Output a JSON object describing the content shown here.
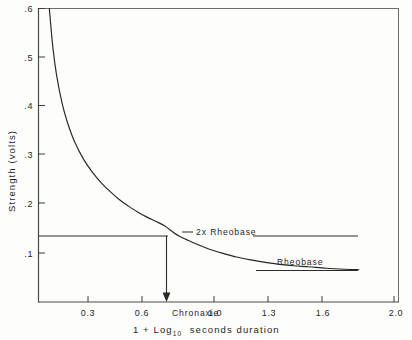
{
  "chart_data": {
    "type": "line",
    "title": "",
    "subtitle": "",
    "xlabel": "1 + Log10  seconds  duration",
    "xlabel_main": "1 + Log",
    "xlabel_sub": "10",
    "xlabel_tail": "seconds  duration",
    "ylabel": "Strength (volts)",
    "xlim": [
      0.0,
      2.0
    ],
    "ylim": [
      0.0,
      0.6
    ],
    "grid": false,
    "legend": "none",
    "x_ticks": [
      0.3,
      0.6,
      1.0,
      1.3,
      1.6,
      2.0
    ],
    "x_tick_labels": [
      "0.3",
      "0.6",
      "1.0",
      "1.3",
      "1.6",
      "2.0"
    ],
    "y_ticks": [
      0.1,
      0.2,
      0.3,
      0.4,
      0.5,
      0.6
    ],
    "y_tick_labels": [
      ".1",
      ".2",
      ".3",
      ".4",
      ".5",
      ".6"
    ],
    "series": [
      {
        "name": "strength-duration curve",
        "x": [
          0.06,
          0.08,
          0.1,
          0.13,
          0.16,
          0.2,
          0.25,
          0.3,
          0.35,
          0.4,
          0.45,
          0.5,
          0.55,
          0.6,
          0.65,
          0.7,
          0.75,
          0.78,
          0.82,
          0.88,
          0.95,
          1.02,
          1.1,
          1.18,
          1.26,
          1.34,
          1.42,
          1.5,
          1.6,
          1.7,
          1.78
        ],
        "y": [
          0.6,
          0.52,
          0.465,
          0.408,
          0.368,
          0.328,
          0.292,
          0.265,
          0.243,
          0.225,
          0.209,
          0.196,
          0.184,
          0.174,
          0.165,
          0.156,
          0.142,
          0.135,
          0.128,
          0.118,
          0.108,
          0.1,
          0.092,
          0.086,
          0.081,
          0.077,
          0.074,
          0.072,
          0.069,
          0.067,
          0.066
        ]
      },
      {
        "name": "2x rheobase level",
        "value": 0.135,
        "x_start": 0.0,
        "x_end": 1.78
      },
      {
        "name": "rheobase level",
        "value": 0.065,
        "x_start": 1.3,
        "x_end": 1.78
      }
    ],
    "annotations": [
      {
        "name": "2x-rheobase",
        "label": "2x  Rheobase",
        "x": 0.8,
        "y": 0.135
      },
      {
        "name": "rheobase",
        "label": "Rheobase",
        "x": 1.28,
        "y": 0.088
      },
      {
        "name": "chronaxie",
        "label": "Chronaxie",
        "x": 0.78,
        "y": 0.0
      }
    ]
  },
  "axes": {
    "y_title": "Strength (volts)",
    "x_title_part1": "1 + Log",
    "x_title_sub": "10",
    "x_title_part2": "seconds  duration"
  },
  "labels": {
    "two_x_rheobase": "2x  Rheobase",
    "rheobase": "Rheobase",
    "chronaxie": "Chronaxie"
  },
  "ticks": {
    "x": [
      "0.3",
      "0.6",
      "1.0",
      "1.3",
      "1.6",
      "2.0"
    ],
    "y": [
      ".1",
      ".2",
      ".3",
      ".4",
      ".5",
      ".6"
    ]
  },
  "colors": {
    "curve": "#262626",
    "axis": "#4a4a4a",
    "background": "#fdfdfc",
    "text": "#1f1f1f"
  }
}
